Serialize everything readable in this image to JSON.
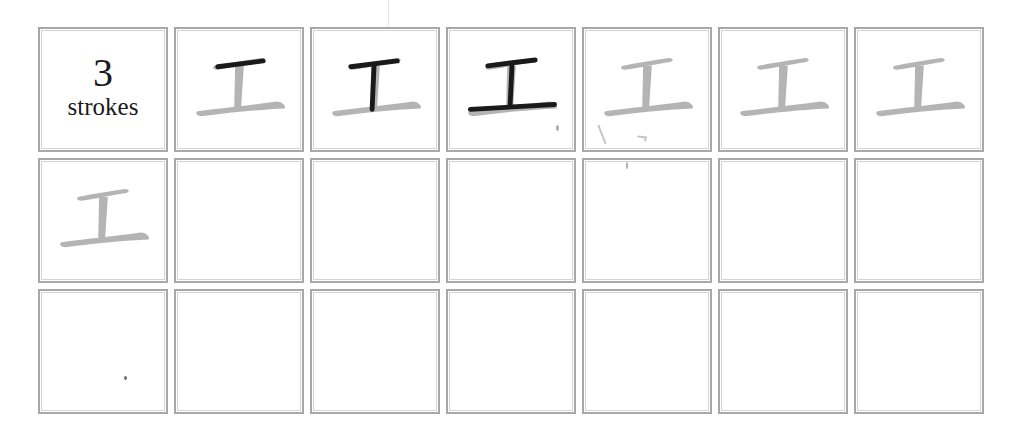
{
  "worksheet": {
    "character": "工",
    "stroke_count": "3",
    "stroke_label": "strokes",
    "colors": {
      "border": "#a8a8a8",
      "trace_gray": "#b4b4b4",
      "ink_black": "#1a1a1a"
    },
    "rows": [
      {
        "cells": [
          {
            "type": "info"
          },
          {
            "type": "stroke-order",
            "strokes_inked": 1
          },
          {
            "type": "stroke-order",
            "strokes_inked": 2
          },
          {
            "type": "stroke-order",
            "strokes_inked": 3
          },
          {
            "type": "trace"
          },
          {
            "type": "trace"
          },
          {
            "type": "trace"
          }
        ]
      },
      {
        "cells": [
          {
            "type": "trace"
          },
          {
            "type": "empty"
          },
          {
            "type": "empty"
          },
          {
            "type": "empty"
          },
          {
            "type": "empty"
          },
          {
            "type": "empty"
          },
          {
            "type": "empty"
          }
        ]
      },
      {
        "cells": [
          {
            "type": "empty"
          },
          {
            "type": "empty"
          },
          {
            "type": "empty"
          },
          {
            "type": "empty"
          },
          {
            "type": "empty"
          },
          {
            "type": "empty"
          },
          {
            "type": "empty"
          }
        ]
      }
    ]
  }
}
